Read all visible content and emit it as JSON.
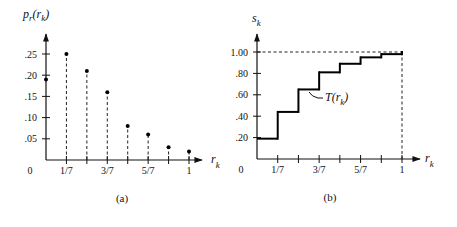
{
  "chart_data": [
    {
      "id": "a",
      "type": "scatter",
      "style": "stem",
      "title": "",
      "caption": "(a)",
      "ylabel_main": "p",
      "ylabel_sub": "r",
      "ylabel_arg": "(r",
      "ylabel_arg_sub": "k",
      "ylabel_close": ")",
      "xlabel_main": "r",
      "xlabel_sub": "k",
      "x": [
        0,
        0.142857,
        0.285714,
        0.428571,
        0.571429,
        0.714286,
        0.857143,
        1.0
      ],
      "values": [
        0.19,
        0.25,
        0.21,
        0.16,
        0.08,
        0.06,
        0.03,
        0.02
      ],
      "xlim": [
        0,
        1
      ],
      "ylim": [
        0,
        0.25
      ],
      "xtick_values": [
        0,
        0.142857,
        0.285714,
        0.428571,
        0.571429,
        0.714286,
        0.857143,
        1.0
      ],
      "xtick_labels": [
        "0",
        "1/7",
        "",
        "3/7",
        "",
        "5/7",
        "",
        "1"
      ],
      "ytick_values": [
        0.05,
        0.1,
        0.15,
        0.2,
        0.25
      ],
      "ytick_labels": [
        ".05",
        ".10",
        ".15",
        ".20",
        ".25"
      ],
      "grid": false
    },
    {
      "id": "b",
      "type": "line",
      "style": "step",
      "title": "",
      "caption": "(b)",
      "ylabel_main": "s",
      "ylabel_sub": "k",
      "xlabel_main": "r",
      "xlabel_sub": "k",
      "annotation": {
        "main": "T(r",
        "sub": "k",
        "close": ")"
      },
      "x": [
        0,
        0.142857,
        0.285714,
        0.428571,
        0.571429,
        0.714286,
        0.857143,
        1.0
      ],
      "values": [
        0.19,
        0.44,
        0.65,
        0.81,
        0.89,
        0.95,
        0.98,
        1.0
      ],
      "xlim": [
        0,
        1
      ],
      "ylim": [
        0,
        1.0
      ],
      "xtick_values": [
        0,
        0.142857,
        0.285714,
        0.428571,
        0.571429,
        0.714286,
        0.857143,
        1.0
      ],
      "xtick_labels": [
        "0",
        "1/7",
        "",
        "3/7",
        "",
        "5/7",
        "",
        "1"
      ],
      "ytick_values": [
        0.2,
        0.4,
        0.6,
        0.8,
        1.0
      ],
      "ytick_labels": [
        ".20",
        ".40",
        ".60",
        ".80",
        "1.00"
      ],
      "reference_lines": {
        "y_at": 1.0,
        "x_at": 1.0
      },
      "grid": false
    }
  ]
}
